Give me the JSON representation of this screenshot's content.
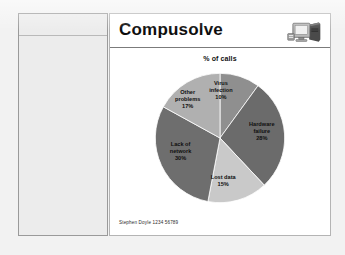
{
  "slide": {
    "title": "Compusolve",
    "logo_icon": "desktop-computer-icon",
    "footer": "Stephen Doyle 1234 56789"
  },
  "left_panel": {
    "content": ""
  },
  "chart_data": {
    "type": "pie",
    "title": "% of calls",
    "xlabel": "",
    "ylabel": "",
    "legend": "none (labels on slices)",
    "grid": false,
    "categories": [
      "Virus infection",
      "Hardware failure",
      "Lost data",
      "Lack of network",
      "Other problems"
    ],
    "values": [
      10,
      28,
      15,
      30,
      17
    ],
    "value_suffix": "%",
    "total": 100,
    "start_angle_deg": 0,
    "direction": "clockwise",
    "colors": [
      "#8f8f8f",
      "#6b6b6b",
      "#c9c9c9",
      "#6e6e6e",
      "#b0b0b0"
    ],
    "slices": [
      {
        "label": "Virus infection",
        "label_line1": "Virus",
        "label_line2": "infection",
        "value": 10,
        "pct_text": "10%",
        "color": "#8f8f8f"
      },
      {
        "label": "Hardware failure",
        "label_line1": "Hardware",
        "label_line2": "failure",
        "value": 28,
        "pct_text": "28%",
        "color": "#6b6b6b"
      },
      {
        "label": "Lost data",
        "label_line1": "Lost data",
        "label_line2": "",
        "value": 15,
        "pct_text": "15%",
        "color": "#c9c9c9"
      },
      {
        "label": "Lack of network",
        "label_line1": "Lack of",
        "label_line2": "network",
        "value": 30,
        "pct_text": "30%",
        "color": "#6e6e6e"
      },
      {
        "label": "Other problems",
        "label_line1": "Other",
        "label_line2": "problems",
        "value": 17,
        "pct_text": "17%",
        "color": "#b0b0b0"
      }
    ]
  }
}
